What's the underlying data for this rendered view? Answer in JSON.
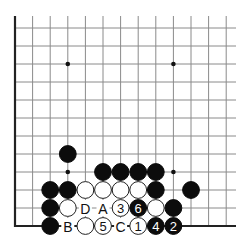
{
  "board": {
    "origin_x": 15,
    "origin_y": 28,
    "spacing_x": 17.6,
    "spacing_y": 18.0,
    "cols": 13,
    "rows": 12,
    "top_extend_y": 16,
    "right_extend_x": 236,
    "edges": [
      "left",
      "bottom"
    ],
    "colors": {
      "line": "#8a8a8a",
      "edge": "#222222",
      "black": "#0c0c0c",
      "white": "#ffffff"
    }
  },
  "star_points": [
    {
      "col": 3,
      "row": 2
    },
    {
      "col": 9,
      "row": 2
    },
    {
      "col": 3,
      "row": 8
    },
    {
      "col": 9,
      "row": 8
    }
  ],
  "stones": [
    {
      "color": "black",
      "col": 3,
      "row": 7
    },
    {
      "color": "black",
      "col": 5,
      "row": 8
    },
    {
      "color": "black",
      "col": 6,
      "row": 8
    },
    {
      "color": "black",
      "col": 7,
      "row": 8
    },
    {
      "color": "black",
      "col": 8,
      "row": 8
    },
    {
      "color": "black",
      "col": 2,
      "row": 9
    },
    {
      "color": "black",
      "col": 3,
      "row": 9
    },
    {
      "color": "white",
      "col": 4,
      "row": 9
    },
    {
      "color": "white",
      "col": 5,
      "row": 9
    },
    {
      "color": "white",
      "col": 6,
      "row": 9
    },
    {
      "color": "white",
      "col": 7,
      "row": 9
    },
    {
      "color": "black",
      "col": 8,
      "row": 9
    },
    {
      "color": "black",
      "col": 10,
      "row": 9
    },
    {
      "color": "black",
      "col": 2,
      "row": 10
    },
    {
      "color": "white",
      "col": 3,
      "row": 10
    },
    {
      "color": "white",
      "col": 6,
      "row": 10,
      "number": "3"
    },
    {
      "color": "black",
      "col": 7,
      "row": 10,
      "number": "6"
    },
    {
      "color": "white",
      "col": 8,
      "row": 10
    },
    {
      "color": "black",
      "col": 9,
      "row": 10
    },
    {
      "color": "black",
      "col": 2,
      "row": 11
    },
    {
      "color": "white",
      "col": 4,
      "row": 11
    },
    {
      "color": "white",
      "col": 5,
      "row": 11,
      "number": "5"
    },
    {
      "color": "white",
      "col": 7,
      "row": 11,
      "number": "1"
    },
    {
      "color": "black",
      "col": 8,
      "row": 11,
      "number": "4"
    },
    {
      "color": "black",
      "col": 9,
      "row": 11,
      "number": "2"
    }
  ],
  "labels": [
    {
      "text": "D",
      "col": 4,
      "row": 10
    },
    {
      "text": "A",
      "col": 5,
      "row": 10
    },
    {
      "text": "B",
      "col": 3,
      "row": 11
    },
    {
      "text": "C",
      "col": 6,
      "row": 11
    }
  ]
}
